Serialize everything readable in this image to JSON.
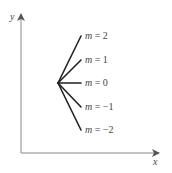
{
  "diagram": {
    "axes": {
      "x_label": "x",
      "y_label": "y"
    },
    "origin_point": {
      "x": 58,
      "y": 83
    },
    "lines": [
      {
        "m": "2",
        "label_var": "m",
        "label_eq": " = 2",
        "end": {
          "x": 81,
          "y": 36
        }
      },
      {
        "m": "1",
        "label_var": "m",
        "label_eq": " = 1",
        "end": {
          "x": 81,
          "y": 60
        }
      },
      {
        "m": "0",
        "label_var": "m",
        "label_eq": " = 0",
        "end": {
          "x": 81,
          "y": 83
        }
      },
      {
        "m": "-1",
        "label_var": "m",
        "label_eq": " = −1",
        "end": {
          "x": 81,
          "y": 107
        }
      },
      {
        "m": "-2",
        "label_var": "m",
        "label_eq": " = −2",
        "end": {
          "x": 81,
          "y": 130
        }
      }
    ],
    "colors": {
      "axis": "#888888",
      "lines": "#222222",
      "text": "#444444",
      "background": "#ffffff"
    }
  }
}
